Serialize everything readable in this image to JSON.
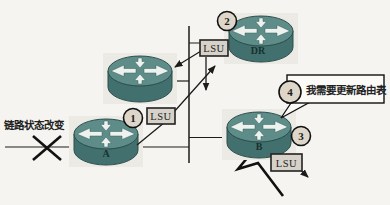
{
  "diagram": {
    "kind": "network-topology-ospf-lsu-flooding",
    "colors": {
      "paper": "#f5f4f0",
      "router_body": "#41706e",
      "router_top": "#5e8c89",
      "router_arrow": "#eef2ee",
      "packet_fill": "#d6d2c9",
      "step_fill": "#ded7c9",
      "line": "#1c1c1c",
      "callout_fill": "#fbfaf7"
    },
    "link_change_label": "链路状态改变",
    "routers": [
      {
        "id": "top",
        "label": ""
      },
      {
        "id": "dr",
        "label": "DR"
      },
      {
        "id": "a",
        "label": "A"
      },
      {
        "id": "b",
        "label": "B"
      }
    ],
    "packets": [
      {
        "label": "LSU"
      },
      {
        "label": "LSU"
      },
      {
        "label": "LSU"
      }
    ],
    "steps": [
      {
        "n": "1"
      },
      {
        "n": "2"
      },
      {
        "n": "3"
      },
      {
        "n": "4"
      }
    ],
    "callout": {
      "text": "我需要更新路由表"
    }
  }
}
